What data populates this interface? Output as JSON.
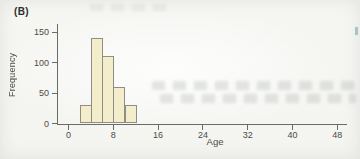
{
  "figure": {
    "panel_label": "(B)"
  },
  "chart_data": {
    "type": "bar",
    "title": "",
    "xlabel": "Age",
    "ylabel": "Frequency",
    "bin_edges": [
      2,
      4,
      6,
      8,
      10,
      12
    ],
    "counts": [
      30,
      140,
      110,
      60,
      30
    ],
    "x_ticks": [
      0,
      8,
      16,
      24,
      32,
      40,
      48
    ],
    "y_ticks": [
      0,
      50,
      100,
      150
    ],
    "xlim": [
      0,
      49
    ],
    "ylim": [
      0,
      163
    ],
    "grid": "off",
    "legend": "none"
  },
  "colors": {
    "bar_fill": "#f4edcb",
    "bar_border": "#8e8e83",
    "axis": "#6a6a66",
    "tick_text": "#4b4b48",
    "panel_text": "#2d2d2b",
    "background": "#f6f6f3"
  }
}
